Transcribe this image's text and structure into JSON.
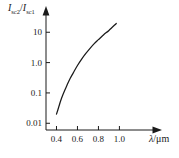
{
  "chart_data": {
    "type": "line",
    "title": "",
    "xlabel": "λ/μm",
    "ylabel": "I_sc2/I_sc1",
    "ylabel_parts": {
      "i1": "I",
      "sub1": "sc2",
      "slash": "/",
      "i2": "I",
      "sub2": "sc1"
    },
    "xlabel_parts": {
      "lambda": "λ",
      "unit": "/μm"
    },
    "xscale": "linear",
    "yscale": "log",
    "xlim": [
      0.3,
      1.12
    ],
    "ylim": [
      0.006,
      40
    ],
    "grid": false,
    "legend": null,
    "x_ticks": [
      0.4,
      0.6,
      0.8,
      1.0
    ],
    "x_tick_labels": [
      "0.4",
      "0.6",
      "0.8",
      "1.0"
    ],
    "y_ticks": [
      0.01,
      0.1,
      1.0,
      10
    ],
    "y_tick_labels": [
      "0.01",
      "0.1",
      "1.0",
      "10"
    ],
    "series": [
      {
        "name": "Isc2/Isc1 vs wavelength",
        "color": "#1a1a1a",
        "x": [
          0.4,
          0.42,
          0.44,
          0.46,
          0.48,
          0.5,
          0.53,
          0.56,
          0.6,
          0.64,
          0.68,
          0.72,
          0.76,
          0.8,
          0.85,
          0.9,
          0.97
        ],
        "values": [
          0.02,
          0.033,
          0.055,
          0.085,
          0.125,
          0.18,
          0.3,
          0.46,
          0.8,
          1.3,
          2.0,
          2.95,
          4.2,
          5.7,
          8.3,
          11.5,
          19.5
        ]
      }
    ]
  },
  "axes": {
    "y_axis_name": "y-axis-line",
    "x_axis_name": "x-axis-line",
    "arrow_y": "y-axis-arrow",
    "arrow_x": "x-axis-arrow"
  }
}
